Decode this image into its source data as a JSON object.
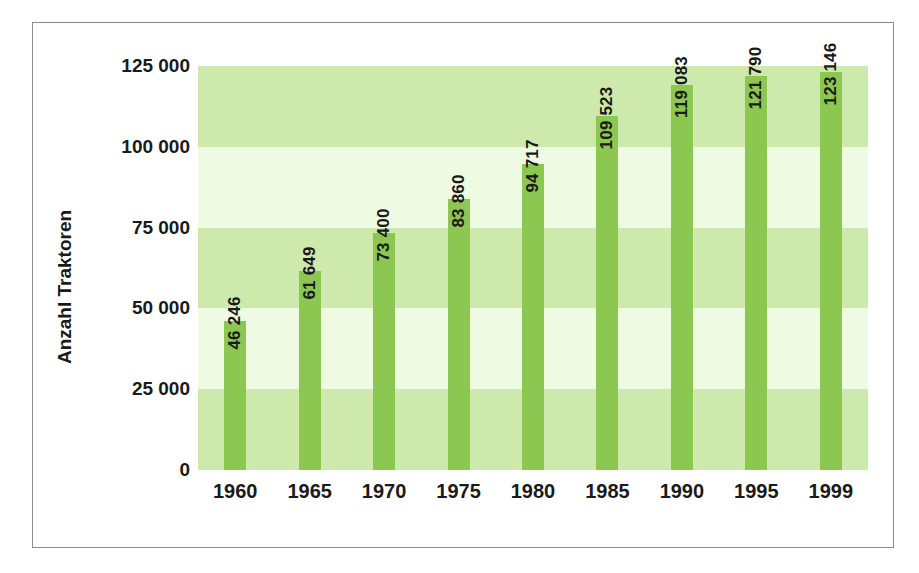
{
  "chart_data": {
    "type": "bar",
    "title": "",
    "subtitle": "",
    "xlabel": "",
    "ylabel": "Anzahl Traktoren",
    "categories": [
      "1960",
      "1965",
      "1970",
      "1975",
      "1980",
      "1985",
      "1990",
      "1995",
      "1999"
    ],
    "values": [
      46246,
      61649,
      73400,
      83860,
      94717,
      109523,
      119083,
      121790,
      123146
    ],
    "value_labels": [
      "46 246",
      "61 649",
      "73 400",
      "83 860",
      "94 717",
      "109 523",
      "119 083",
      "121 790",
      "123 146"
    ],
    "ylim": [
      0,
      125000
    ],
    "ytick_values": [
      0,
      25000,
      50000,
      75000,
      100000,
      125000
    ],
    "ytick_labels": [
      "0",
      "25 000",
      "50 000",
      "75 000",
      "100 000",
      "125 000"
    ],
    "grid": false,
    "legend": null,
    "legend_position": "none",
    "bands": [
      {
        "from": 0,
        "to": 25000,
        "shade": "dark"
      },
      {
        "from": 25000,
        "to": 50000,
        "shade": "light"
      },
      {
        "from": 50000,
        "to": 75000,
        "shade": "dark"
      },
      {
        "from": 75000,
        "to": 100000,
        "shade": "light"
      },
      {
        "from": 100000,
        "to": 125000,
        "shade": "dark"
      }
    ],
    "colors": {
      "bar": "#8cc751",
      "band_dark": "#cdeaac",
      "band_light": "#effae3",
      "text": "#1a1a1a",
      "frame": "#8a8a8a",
      "background": "#ffffff"
    }
  }
}
